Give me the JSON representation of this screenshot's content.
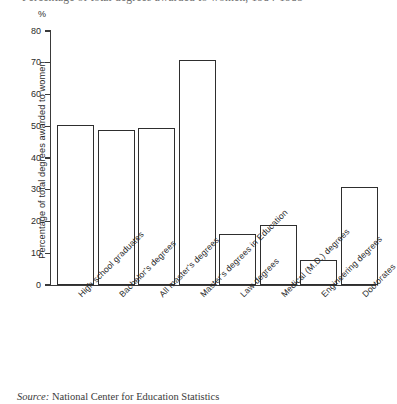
{
  "chart_data": {
    "type": "bar",
    "title": "Percentage of total degrees awarded to women, 1984-1985",
    "subtitle": "",
    "xlabel": "",
    "ylabel": "Percentage of total degrees awarded to women",
    "unit_label": "%",
    "ylim": [
      0,
      80
    ],
    "ytick_labels": [
      "80",
      "70",
      "60",
      "50",
      "40",
      "30",
      "20",
      "10",
      "0"
    ],
    "ytick_values": [
      80,
      70,
      60,
      50,
      40,
      30,
      20,
      10,
      0
    ],
    "grid": false,
    "legend": "none",
    "categories": [
      "High school graduates",
      "Bachelor's degrees",
      "All master's degrees",
      "Master's degrees in Education",
      "Law degrees",
      "Medical (M.D.) degrees",
      "Engineering degrees",
      "Doctorates"
    ],
    "values": [
      50.5,
      48.8,
      49.3,
      70.9,
      16.1,
      19.0,
      8.0,
      31.0
    ],
    "bar_fill": "#ffffff",
    "bar_edge": "#2e2e2e"
  },
  "source": {
    "lead": "Source:",
    "text": "National Center for Education Statistics"
  }
}
